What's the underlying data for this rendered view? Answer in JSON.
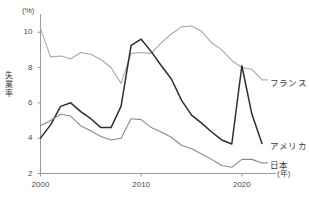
{
  "chart_data": {
    "type": "line",
    "title": "",
    "subtitle": "",
    "xlabel": "(年)",
    "ylabel": "失業率",
    "yunit": "(%)",
    "xlim": [
      2000,
      2022
    ],
    "ylim": [
      2,
      11
    ],
    "grid": false,
    "legend_position": "right-inline-labels",
    "yticks": [
      2,
      4,
      6,
      8,
      10
    ],
    "ytick_labels": [
      "2",
      "4",
      "6",
      "8",
      "10"
    ],
    "xticks": [
      2000,
      2010,
      2020
    ],
    "xtick_labels": [
      "2000",
      "2010",
      "2020"
    ],
    "x": [
      2000,
      2001,
      2002,
      2003,
      2004,
      2005,
      2006,
      2007,
      2008,
      2009,
      2010,
      2011,
      2012,
      2013,
      2014,
      2015,
      2016,
      2017,
      2018,
      2019,
      2020,
      2021,
      2022
    ],
    "series": [
      {
        "name": "フランス",
        "color": "#a9a9a9",
        "width": 1.1,
        "values": [
          10.2,
          8.6,
          8.65,
          8.5,
          8.85,
          8.75,
          8.45,
          8.0,
          7.1,
          8.8,
          8.85,
          8.8,
          9.4,
          9.9,
          10.3,
          10.35,
          10.05,
          9.4,
          9.0,
          8.4,
          8.0,
          7.9,
          7.3
        ]
      },
      {
        "name": "アメリカ",
        "color": "#2e2e2e",
        "width": 1.5,
        "values": [
          4.0,
          4.75,
          5.8,
          6.0,
          5.5,
          5.1,
          4.6,
          4.6,
          5.8,
          9.25,
          9.6,
          8.9,
          8.1,
          7.35,
          6.15,
          5.3,
          4.85,
          4.35,
          3.9,
          3.67,
          8.1,
          5.35,
          3.7
        ]
      },
      {
        "name": "日本",
        "color": "#8a8a8a",
        "width": 1.1,
        "values": [
          4.7,
          5.0,
          5.35,
          5.25,
          4.7,
          4.4,
          4.1,
          3.9,
          4.0,
          5.1,
          5.05,
          4.6,
          4.35,
          4.05,
          3.6,
          3.4,
          3.1,
          2.8,
          2.45,
          2.35,
          2.8,
          2.8,
          2.6
        ]
      }
    ],
    "annotations": [
      {
        "text": "フランス",
        "series": "フランス"
      },
      {
        "text": "アメリカ",
        "series": "アメリカ"
      },
      {
        "text": "日本",
        "series": "日本"
      }
    ]
  },
  "axis": {
    "y_unit_label": "(%)",
    "y_title": "失業率",
    "x_unit_label": "(年)"
  },
  "labels": {
    "france": "フランス",
    "america": "アメリカ",
    "japan": "日本"
  },
  "colors": {
    "axis": "#9a9a9a",
    "text": "#3a3a3a",
    "france": "#a9a9a9",
    "america": "#2e2e2e",
    "japan": "#8a8a8a",
    "background": "#ffffff"
  }
}
